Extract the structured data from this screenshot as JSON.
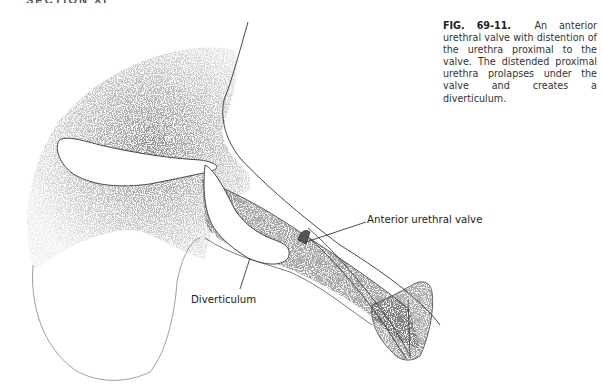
{
  "page": {
    "header_cropped": "SECTION XI"
  },
  "figure": {
    "number": "FIG. 69-11.",
    "caption": "An anterior urethral valve with distention of the urethra proximal to the valve. The distended proximal urethra prolapses under the valve and creates a diverticulum.",
    "caption_lines": [
      "valve with distention of the ure-",
      "thra proximal to the valve. The dis-",
      "tended proximal urethra prolapses",
      "under the valve and creates a",
      "diverticulum."
    ],
    "caption_first_line_text": "An anterior urethral",
    "labels": {
      "anterior_urethral_valve": "Anterior urethral valve",
      "diverticulum": "Diverticulum"
    },
    "colors": {
      "ink": "#222222",
      "stipple": "#3a3a3a",
      "background": "#ffffff"
    }
  }
}
